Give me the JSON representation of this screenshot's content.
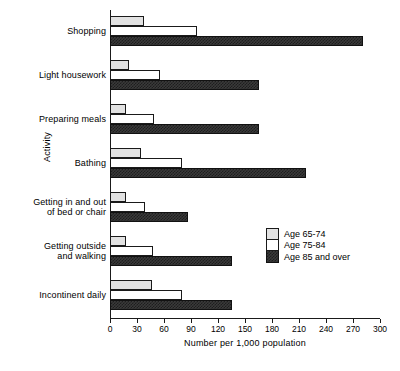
{
  "chart_data": {
    "type": "bar",
    "orientation": "horizontal",
    "title": "",
    "xlabel": "Number per 1,000 population",
    "ylabel": "Activity",
    "xlim": [
      0,
      300
    ],
    "xticks": [
      0,
      30,
      60,
      90,
      120,
      150,
      180,
      210,
      240,
      270,
      300
    ],
    "grid": false,
    "legend_position": "right-middle",
    "categories": [
      "Shopping",
      "Light housework",
      "Preparing meals",
      "Bathing",
      "Getting in and out\nof bed or chair",
      "Getting outside\nand walking",
      "Incontinent daily"
    ],
    "series": [
      {
        "name": "Age 65-74",
        "color": "#e2e2e2",
        "values": [
          38,
          21,
          18,
          34,
          18,
          18,
          47
        ]
      },
      {
        "name": "Age 75-84",
        "color": "#ffffff",
        "values": [
          97,
          55,
          49,
          80,
          39,
          48,
          80
        ]
      },
      {
        "name": "Age 85 and over",
        "color": "#3a3a3a",
        "values": [
          281,
          165,
          166,
          218,
          87,
          135,
          136
        ]
      }
    ]
  },
  "legend": {
    "items": [
      {
        "label": "Age 65-74"
      },
      {
        "label": "Age 75-84"
      },
      {
        "label": "Age 85 and over"
      }
    ]
  }
}
